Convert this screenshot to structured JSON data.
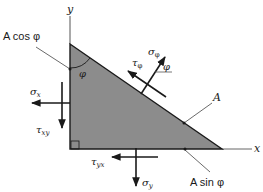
{
  "diagram": {
    "type": "stress-element-wedge",
    "colors": {
      "wedge_fill": "#8c8c8c",
      "stroke": "#1a1a1a",
      "axis": "#555555",
      "leader": "#444444"
    },
    "axes": {
      "x_label": "x",
      "y_label": "y"
    },
    "faces": {
      "vertical_face_label": "A cos φ",
      "hypotenuse_label": "A",
      "bottom_face_label": "A sin φ"
    },
    "angle": {
      "wedge_angle_label": "φ",
      "normal_angle_label": "φ"
    },
    "stresses": {
      "sigma_phi": "σφ",
      "tau_phi": "τφ",
      "sigma_x": "σx",
      "tau_xy": "τxy",
      "tau_yx": "τyx",
      "sigma_y": "σy"
    },
    "labels_rendered": {
      "sigma_phi_base": "σ",
      "sigma_phi_sub": "φ",
      "tau_phi_base": "τ",
      "tau_phi_sub": "φ",
      "sigma_x_base": "σ",
      "sigma_x_sub": "x",
      "tau_xy_base": "τ",
      "tau_xy_sub": "xy",
      "tau_yx_base": "τ",
      "tau_yx_sub": "yx",
      "sigma_y_base": "σ",
      "sigma_y_sub": "y"
    }
  }
}
